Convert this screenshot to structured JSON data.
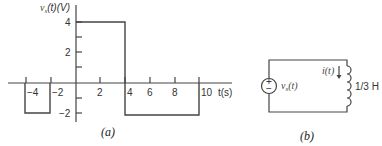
{
  "figure_a": {
    "caption": "(a)",
    "y_label": "v",
    "y_label_sub": "s",
    "y_label_rest": "(t)(V)",
    "x_label": "t(s)",
    "y_ticks": [
      {
        "value": 4,
        "label": "4"
      },
      {
        "value": 2,
        "label": "2"
      },
      {
        "value": -2,
        "label": "−2"
      }
    ],
    "x_ticks": [
      {
        "value": -4,
        "label": "−4"
      },
      {
        "value": -2,
        "label": "−2"
      },
      {
        "value": 2,
        "label": "2"
      },
      {
        "value": 4,
        "label": "4"
      },
      {
        "value": 6,
        "label": "6"
      },
      {
        "value": 8,
        "label": "8"
      },
      {
        "value": 10,
        "label": "10"
      }
    ],
    "segments": [
      {
        "t_start": -5,
        "t_end": -3,
        "value": -2
      },
      {
        "t_start": 0,
        "t_end": 4,
        "value": 4
      },
      {
        "t_start": 4,
        "t_end": 10,
        "value": -2
      }
    ]
  },
  "figure_b": {
    "caption": "(b)",
    "source_label": "v",
    "source_label_sub": "s",
    "source_label_rest": "(t)",
    "source_plus": "+",
    "source_minus": "−",
    "current_label": "i(t)",
    "inductor_label": "1/3 H"
  }
}
